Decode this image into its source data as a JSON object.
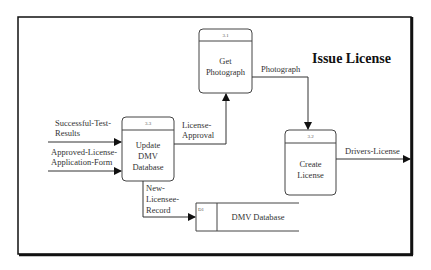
{
  "diagram": {
    "type": "data-flow-diagram",
    "title": "Issue License",
    "processes": [
      {
        "id": "3.1",
        "name_lines": [
          "Get",
          "Photograph"
        ]
      },
      {
        "id": "3.2",
        "name_lines": [
          "Create",
          "License"
        ]
      },
      {
        "id": "3.3",
        "name_lines": [
          "Update",
          "DMV",
          "Database"
        ]
      }
    ],
    "data_store": {
      "id": "D1",
      "name": "DMV Database"
    },
    "flows": [
      {
        "label_lines": [
          "Successful-Test-",
          "Results"
        ],
        "from": "external",
        "to": "3.3"
      },
      {
        "label_lines": [
          "Approved-License-",
          "Application-Form"
        ],
        "from": "external",
        "to": "3.3"
      },
      {
        "label_lines": [
          "License-",
          "Approval"
        ],
        "from": "3.3",
        "to": "3.1"
      },
      {
        "label_lines": [
          "Photograph"
        ],
        "from": "3.1",
        "to": "3.2"
      },
      {
        "label_lines": [
          "Drivers-License"
        ],
        "from": "3.2",
        "to": "external"
      },
      {
        "label_lines": [
          "New-",
          "Licensee-",
          "Record"
        ],
        "from": "3.3",
        "to": "D1"
      }
    ]
  },
  "colors": {
    "line": "#333333",
    "frame": "#111111",
    "background": "#ffffff"
  }
}
